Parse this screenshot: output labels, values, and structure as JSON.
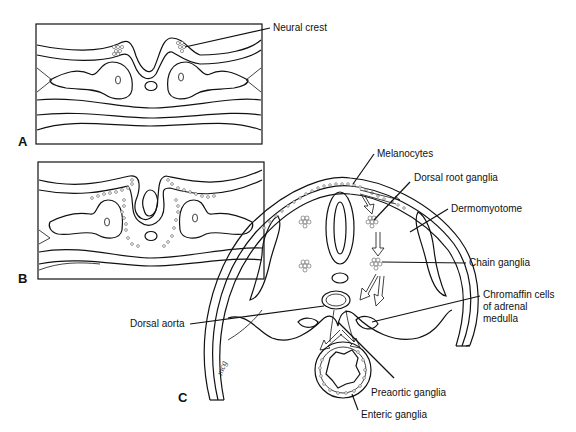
{
  "figure": {
    "panels": [
      {
        "id": "A",
        "label": "A",
        "description": "Neural fold stage with neural crest cells at the crests of the folds"
      },
      {
        "id": "B",
        "label": "B",
        "description": "Neural tube closing with neural crest cells migrating away"
      },
      {
        "id": "C",
        "label": "C",
        "description": "Cross-section showing destinations of migrating neural crest cells"
      }
    ],
    "labels": {
      "neural_crest": "Neural crest",
      "melanocytes": "Melanocytes",
      "dorsal_root_ganglia": "Dorsal root ganglia",
      "dermomyotome": "Dermomyotome",
      "chain_ganglia": "Chain ganglia",
      "chromaffin_line1": "Chromaffin cells",
      "chromaffin_line2": "of adrenal",
      "chromaffin_line3": "medulla",
      "dorsal_aorta": "Dorsal aorta",
      "preaortic_ganglia": "Preaortic ganglia",
      "enteric_ganglia": "Enteric ganglia"
    },
    "signature": "mcg"
  }
}
